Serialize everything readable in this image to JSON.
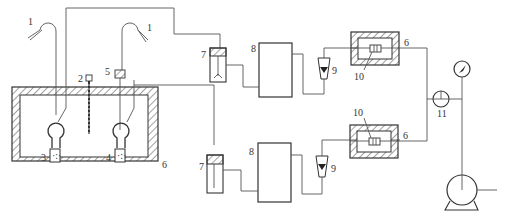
{
  "diagram": {
    "type": "experimental apparatus schematic",
    "labels": {
      "l1a": "1",
      "l1b": "1",
      "l2": "2",
      "l3": "3",
      "l4": "4",
      "l5": "5",
      "l6_bath": "6",
      "l6_top": "6",
      "l6_bottom": "6",
      "l7_top": "7",
      "l7_bottom": "7",
      "l8_top": "8",
      "l8_bottom": "8",
      "l9_top": "9",
      "l9_bottom": "9",
      "l10_top": "10",
      "l10_bottom": "10",
      "l11": "11"
    },
    "components": [
      {
        "id": "1",
        "name": "gas inlet hood / probe (x2)"
      },
      {
        "id": "2",
        "name": "thermometer"
      },
      {
        "id": "3",
        "name": "sample flask (left)"
      },
      {
        "id": "4",
        "name": "sample flask (right)"
      },
      {
        "id": "5",
        "name": "filter element"
      },
      {
        "id": "6",
        "name": "thermostatic enclosure (bath and heaters)"
      },
      {
        "id": "7",
        "name": "absorber / drying tube (x2)"
      },
      {
        "id": "8",
        "name": "buffer vessel (x2)"
      },
      {
        "id": "9",
        "name": "rotameter / flow meter (x2)"
      },
      {
        "id": "10",
        "name": "sensor element inside heated box (x2)"
      },
      {
        "id": "11",
        "name": "three-way valve"
      },
      {
        "id": "gauge",
        "name": "pressure gauge"
      },
      {
        "id": "pump",
        "name": "vacuum pump"
      }
    ],
    "colors": {
      "line": "#555555",
      "outline": "#333333",
      "background": "#ffffff"
    }
  }
}
